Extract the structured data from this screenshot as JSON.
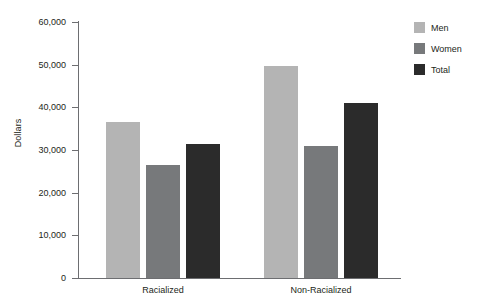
{
  "chart_data": {
    "type": "bar",
    "title": "",
    "xlabel": "",
    "ylabel": "Dollars",
    "categories": [
      "Racialized",
      "Non-Racialized"
    ],
    "series": [
      {
        "name": "Men",
        "color": "#b4b4b4",
        "values": [
          36500,
          49800
        ]
      },
      {
        "name": "Women",
        "color": "#77797b",
        "values": [
          26500,
          31000
        ]
      },
      {
        "name": "Total",
        "color": "#2b2b2b",
        "values": [
          31500,
          41000
        ]
      }
    ],
    "ylim": [
      0,
      60000
    ],
    "ytick_values": [
      0,
      10000,
      20000,
      30000,
      40000,
      50000,
      60000
    ],
    "ytick_labels": [
      "0",
      "10,000",
      "20,000",
      "30,000",
      "40,000",
      "50,000",
      "60,000"
    ],
    "grid": false,
    "legend_position": "right"
  },
  "legend": {
    "items": [
      {
        "label": "Men"
      },
      {
        "label": "Women"
      },
      {
        "label": "Total"
      }
    ]
  },
  "axis": {
    "y_title": "Dollars"
  }
}
